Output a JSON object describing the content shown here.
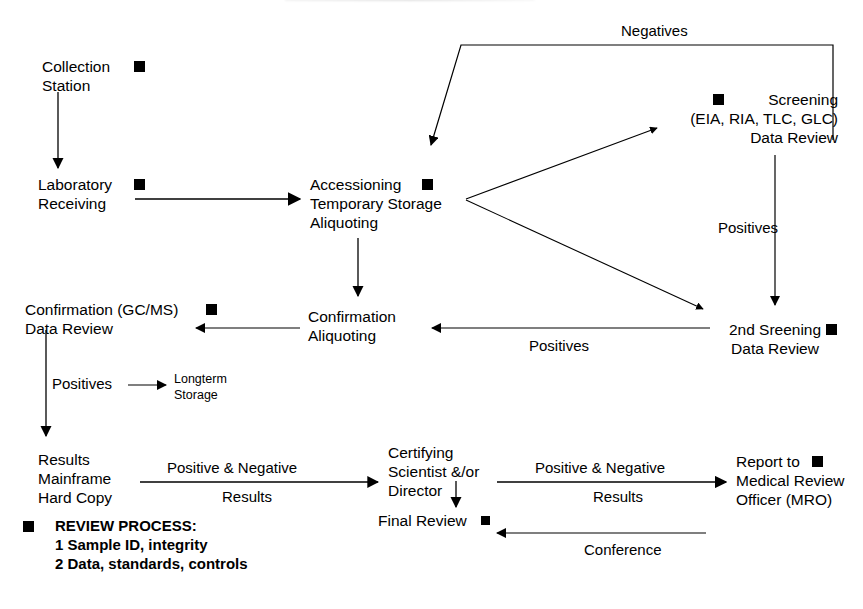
{
  "diagram": {
    "type": "flowchart"
  },
  "nodes": [
    {
      "id": "collection-station",
      "label": "Collection\nStation",
      "marker": true
    },
    {
      "id": "laboratory-receiving",
      "label": "Laboratory\nReceiving",
      "marker": true
    },
    {
      "id": "accessioning",
      "label": "Accessioning\nTemporary Storage\nAliquoting",
      "marker": true
    },
    {
      "id": "screening",
      "label": "Screening\n(EIA, RIA, TLC, GLC)\nData Review",
      "marker": true
    },
    {
      "id": "second-screening",
      "label": "2nd Sreening\nData Review",
      "marker": true
    },
    {
      "id": "confirmation-aliquoting",
      "label": "Confirmation\nAliquoting",
      "marker": false
    },
    {
      "id": "confirmation-gcms",
      "label": "Confirmation (GC/MS)\nData Review",
      "marker": true
    },
    {
      "id": "longterm-storage",
      "label": "Longterm\nStorage",
      "marker": false
    },
    {
      "id": "results-mainframe",
      "label": "Results\nMainframe\nHard Copy",
      "marker": false
    },
    {
      "id": "certifying-scientist",
      "label": "Certifying\nScientist &/or\nDirector",
      "marker": false
    },
    {
      "id": "final-review",
      "label": "Final Review",
      "marker": true
    },
    {
      "id": "report-mro",
      "label": "Report to\nMedical Review\nOfficer (MRO)",
      "marker": true
    }
  ],
  "edge_labels": {
    "negatives": "Negatives",
    "positives_screening": "Positives",
    "positives_second": "Positives",
    "positives_confirmation": "Positives",
    "results_top_1": "Positive & Negative",
    "results_top_2": "Results",
    "results_bottom_1": "Positive & Negative",
    "results_bottom_2": "Results",
    "conference": "Conference"
  },
  "legend": {
    "title": "REVIEW PROCESS:",
    "items": [
      "1 Sample ID, integrity",
      "2 Data, standards, controls"
    ]
  },
  "colors": {
    "ink": "#000000",
    "background": "#ffffff"
  }
}
